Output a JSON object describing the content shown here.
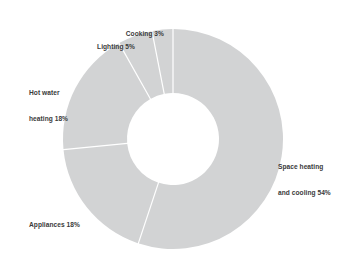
{
  "chart_data": {
    "type": "pie",
    "variant": "donut",
    "title": "",
    "subtitle": "",
    "xlabel": "",
    "ylabel": "",
    "legend_position": "none",
    "grid": false,
    "units": "percent",
    "total": 98,
    "start_angle_deg": 0,
    "direction": "clockwise",
    "categories": [
      "Space heating and cooling",
      "Appliances",
      "Hot water heating",
      "Lighting",
      "Cooking"
    ],
    "values": [
      54,
      18,
      18,
      5,
      3
    ],
    "labels": [
      "Space heating and cooling 54%",
      "Appliances 18%",
      "Hot water heating 18%",
      "Lighting 5%",
      "Cooking 3%"
    ],
    "slice_color": "#d2d3d4",
    "separator_color": "#ffffff",
    "background_color": "#ffffff",
    "label_color": "#3a3a3a"
  },
  "geometry": {
    "center_x": 173,
    "center_y": 139,
    "outer_radius": 110,
    "inner_radius": 46,
    "separator_width": 1.2
  },
  "slices": [
    {
      "name": "space-heating-and-cooling",
      "category": "Space heating and cooling",
      "value": 54,
      "percent_text": "54%",
      "label_line_1": "Space heating",
      "label_line_2": "and cooling 54%"
    },
    {
      "name": "appliances",
      "category": "Appliances",
      "value": 18,
      "percent_text": "18%",
      "label_line_1": "Appliances 18%",
      "label_line_2": ""
    },
    {
      "name": "hot-water-heating",
      "category": "Hot water heating",
      "value": 18,
      "percent_text": "18%",
      "label_line_1": "Hot water",
      "label_line_2": "heating 18%"
    },
    {
      "name": "lighting",
      "category": "Lighting",
      "value": 5,
      "percent_text": "5%",
      "label_line_1": "Lighting 5%",
      "label_line_2": ""
    },
    {
      "name": "cooking",
      "category": "Cooking",
      "value": 3,
      "percent_text": "3%",
      "label_line_1": "Cooking 3%",
      "label_line_2": ""
    }
  ]
}
